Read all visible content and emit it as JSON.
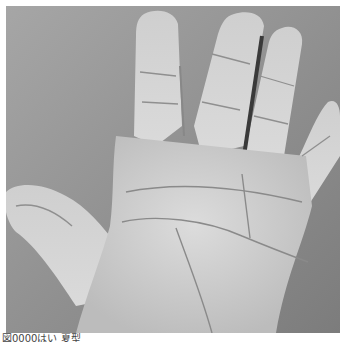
{
  "image": {
    "subject": "palm-of-open-hand",
    "style": "grayscale-photograph",
    "colors": {
      "background": "#9a9a9a",
      "background_dark": "#7c7c7c",
      "skin_light": "#d6d6d6",
      "skin_mid": "#bdbdbd",
      "skin_shadow": "#8a8a8a",
      "crease": "#8f8f8f",
      "finger_gap": "#3a3a3a",
      "page": "#ffffff"
    }
  },
  "caption": {
    "text": "図0000はい 夏型"
  }
}
